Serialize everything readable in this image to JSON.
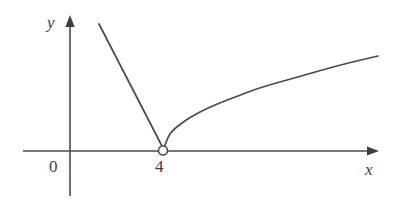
{
  "figure": {
    "name": "piecewise-function-graph",
    "background_color": "#ffffff",
    "stroke_color": "#4a4a4a",
    "text_color": "#3d3d3d"
  },
  "labels": {
    "y_axis": "y",
    "x_axis": "x",
    "origin": "0",
    "x_tick_4": "4"
  },
  "chart_data": {
    "type": "line",
    "title": "",
    "xlabel": "x",
    "ylabel": "y",
    "grid": false,
    "legend": null,
    "axes": {
      "x_axis_pixel_y": 151,
      "y_axis_pixel_x": 70,
      "x_axis_from_px": 23,
      "x_axis_to_px": 378,
      "y_axis_from_px": 16,
      "y_axis_to_px": 196,
      "x_arrow": true,
      "y_arrow": true
    },
    "annotations": [
      {
        "kind": "open-circle",
        "label": "4",
        "x_px": 163,
        "y_px": 151,
        "radius_px": 4.5,
        "note": "removed point at x = 4, y = 0"
      }
    ],
    "ticks": {
      "x": [
        {
          "label": "0",
          "x_px": 70
        },
        {
          "label": "4",
          "x_px": 163
        }
      ],
      "y": []
    },
    "series": [
      {
        "name": "left-branch-line",
        "description": "descending straight segment approaching x = 4 from the left",
        "points_px": [
          [
            99,
            24
          ],
          [
            163,
            148
          ]
        ]
      },
      {
        "name": "right-branch-sqrt-curve",
        "description": "square-root shaped curve rising from x = 4 to the right",
        "points_px": [
          [
            164,
            148
          ],
          [
            168,
            137
          ],
          [
            172,
            131
          ],
          [
            178,
            126
          ],
          [
            186,
            120
          ],
          [
            196,
            114
          ],
          [
            208,
            108
          ],
          [
            222,
            102
          ],
          [
            238,
            96
          ],
          [
            256,
            89
          ],
          [
            276,
            83
          ],
          [
            298,
            77
          ],
          [
            322,
            70
          ],
          [
            348,
            63
          ],
          [
            378,
            56
          ]
        ]
      }
    ]
  }
}
